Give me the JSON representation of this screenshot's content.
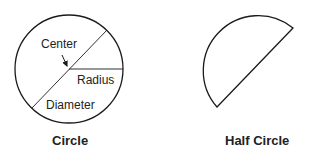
{
  "figures": {
    "circle": {
      "caption": "Circle",
      "labels": {
        "center": "Center",
        "radius": "Radius",
        "diameter": "Diameter"
      }
    },
    "half_circle": {
      "caption": "Half Circle"
    }
  },
  "colors": {
    "stroke": "#1a1a1a",
    "background": "#ffffff"
  }
}
